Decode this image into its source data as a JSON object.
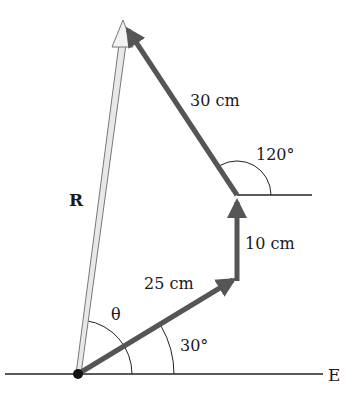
{
  "diagram": {
    "type": "vector-addition",
    "axis_label": "E",
    "vectors": [
      {
        "name": "v1",
        "label": "25 cm",
        "magnitude_cm": 25,
        "angle_deg": 30
      },
      {
        "name": "v2",
        "label": "10 cm",
        "magnitude_cm": 10,
        "angle_deg": 90
      },
      {
        "name": "v3",
        "label": "30 cm",
        "magnitude_cm": 30,
        "angle_deg": 120
      }
    ],
    "resultant": {
      "label": "R"
    },
    "angles": {
      "theta": "θ",
      "v1_angle": "30°",
      "v3_angle": "120°"
    },
    "colors": {
      "vector": "#555555",
      "resultant_fill": "#e8e8e8",
      "resultant_stroke": "#777777",
      "line": "#222222"
    }
  }
}
